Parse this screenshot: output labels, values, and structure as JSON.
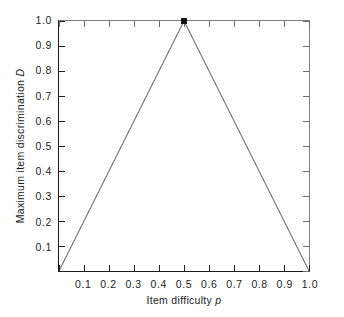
{
  "figure": {
    "background_color": "#ffffff",
    "line_color": "#1a1a1a",
    "frame_color": "#1a1a1a",
    "frame_color_light": "#7d7d7d",
    "marker_color": "#111111"
  },
  "axis_titles": {
    "x_prefix": "Item difficulty ",
    "x_symbol": "p",
    "y_prefix": "Maximum item discrimination ",
    "y_symbol": "D"
  },
  "chart_data": {
    "type": "line",
    "title": "",
    "subtitle": "",
    "xlabel": "Item difficulty p",
    "ylabel": "Maximum item discrimination D",
    "xlim": [
      0.0,
      1.0
    ],
    "ylim": [
      0.0,
      1.0
    ],
    "grid": false,
    "legend": null,
    "legend_position": "none",
    "xticks": [
      0.0,
      0.1,
      0.2,
      0.3,
      0.4,
      0.5,
      0.6,
      0.7,
      0.8,
      0.9,
      1.0
    ],
    "yticks": [
      0.0,
      0.1,
      0.2,
      0.3,
      0.4,
      0.5,
      0.6,
      0.7,
      0.8,
      0.9,
      1.0
    ],
    "xticklabels": [
      "",
      "0.1",
      "0.2",
      "0.3",
      "0.4",
      "0.5",
      "0.6",
      "0.7",
      "0.8",
      "0.9",
      "1.0"
    ],
    "yticklabels": [
      "",
      "0.1",
      "0.2",
      "0.3",
      "0.4",
      "0.5",
      "0.6",
      "0.7",
      "0.8",
      "0.9",
      "1.0"
    ],
    "series": [
      {
        "name": "Maximum item discrimination",
        "x": [
          0.0,
          0.5,
          1.0
        ],
        "values": [
          0.0,
          1.0,
          0.0
        ]
      }
    ],
    "markers": [
      {
        "x": 0.5,
        "y": 1.0,
        "shape": "square",
        "label": ""
      }
    ],
    "annotations": []
  }
}
